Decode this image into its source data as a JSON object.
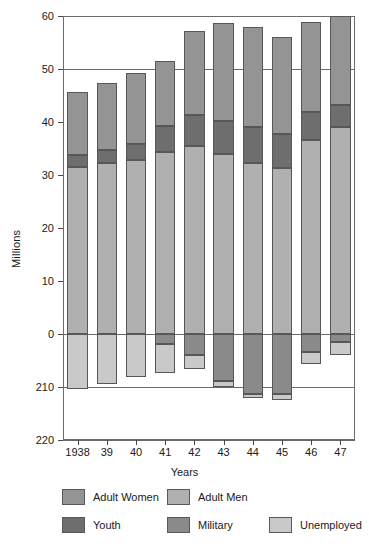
{
  "chart_data": {
    "type": "bar",
    "stacked": true,
    "title": "",
    "xlabel": "Years",
    "ylabel": "Millions",
    "categories": [
      "1938",
      "39",
      "40",
      "41",
      "42",
      "43",
      "44",
      "45",
      "46",
      "47"
    ],
    "ylim": [
      -20,
      60
    ],
    "yticks": [
      60,
      50,
      40,
      30,
      20,
      10,
      0,
      -10,
      -20
    ],
    "ytick_labels": [
      "60",
      "50",
      "40",
      "30",
      "20",
      "10",
      "0",
      "210",
      "220"
    ],
    "grid": true,
    "gridlines_at": [
      60,
      50,
      0,
      -10,
      -20
    ],
    "legend_position": "bottom",
    "series": [
      {
        "name": "Adult Men",
        "color": "#b0b0b0",
        "direction": "positive",
        "values": [
          31.6,
          32.3,
          32.9,
          34.3,
          35.5,
          33.9,
          32.2,
          31.4,
          36.6,
          39.1
        ]
      },
      {
        "name": "Youth",
        "color": "#6e6e6e",
        "direction": "positive",
        "values": [
          2.2,
          2.4,
          3.0,
          5.0,
          5.9,
          6.3,
          6.8,
          6.3,
          5.3,
          4.2
        ]
      },
      {
        "name": "Adult Women",
        "color": "#949494",
        "direction": "positive",
        "values": [
          11.9,
          12.6,
          13.3,
          12.3,
          15.8,
          18.4,
          18.9,
          18.4,
          17.0,
          16.7
        ]
      },
      {
        "name": "Military",
        "color": "#8a8a8a",
        "direction": "negative",
        "values": [
          0.0,
          0.0,
          0.0,
          1.8,
          3.9,
          8.9,
          11.4,
          11.4,
          3.4,
          1.6
        ]
      },
      {
        "name": "Unemployed",
        "color": "#c9c9c9",
        "direction": "negative",
        "values": [
          10.4,
          9.5,
          8.1,
          5.6,
          2.7,
          1.1,
          0.7,
          1.0,
          2.3,
          2.3
        ]
      }
    ],
    "bar_totals_positive": [
      45.7,
      47.3,
      49.2,
      51.6,
      57.2,
      58.6,
      57.9,
      56.1,
      58.9,
      60.0
    ]
  },
  "legend": {
    "items": [
      {
        "label": "Adult Women",
        "color": "#949494"
      },
      {
        "label": "Adult Men",
        "color": "#b0b0b0"
      },
      {
        "label": "Youth",
        "color": "#6e6e6e"
      },
      {
        "label": "Military",
        "color": "#8a8a8a"
      },
      {
        "label": "Unemployed",
        "color": "#c9c9c9"
      }
    ]
  },
  "axes": {
    "y_title": "Millions",
    "x_title": "Years"
  }
}
